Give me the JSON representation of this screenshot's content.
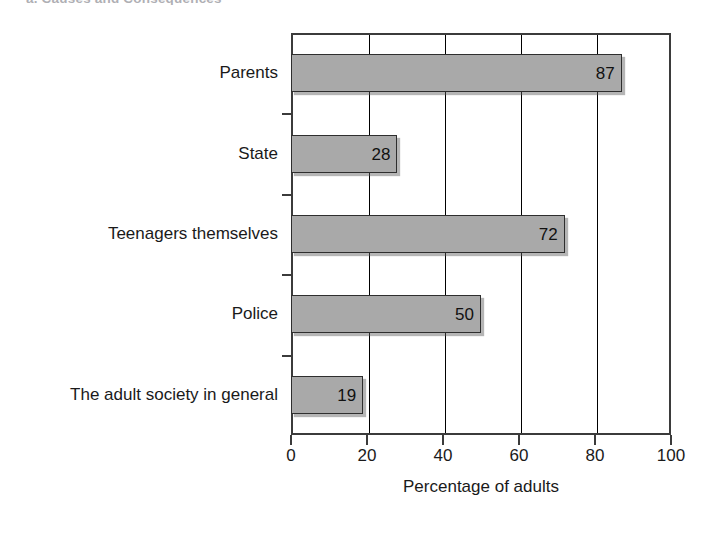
{
  "figure": {
    "clipped_caption": "a. Causes and Consequences",
    "plot": {
      "left": 291,
      "top": 33,
      "width": 380,
      "height": 402
    }
  },
  "chart_data": {
    "type": "bar",
    "orientation": "horizontal",
    "title": "",
    "xlabel": "Percentage of adults",
    "ylabel": "",
    "categories": [
      "Parents",
      "State",
      "Teenagers themselves",
      "Police",
      "The adult society in general"
    ],
    "values": [
      87,
      28,
      72,
      50,
      19
    ],
    "value_labels": [
      "87",
      "28",
      "72",
      "50",
      "19"
    ],
    "xlim": [
      0,
      100
    ],
    "xticks": [
      0,
      20,
      40,
      60,
      80,
      100
    ],
    "xticklabels": [
      "0",
      "20",
      "40",
      "60",
      "80",
      "100"
    ],
    "grid": "vertical gridlines at each x tick",
    "legend": null,
    "series": [
      {
        "name": "Percentage of adults",
        "values": [
          87,
          28,
          72,
          50,
          19
        ],
        "color": "#a9a9a9",
        "edge_color": "#2e2e2e"
      }
    ],
    "colors": {
      "bar_fill": "#a9a9a9",
      "bar_edge": "#2e2e2e",
      "axis": "#3b3b3b",
      "text": "#1a1a1a",
      "background": "#ffffff"
    }
  }
}
